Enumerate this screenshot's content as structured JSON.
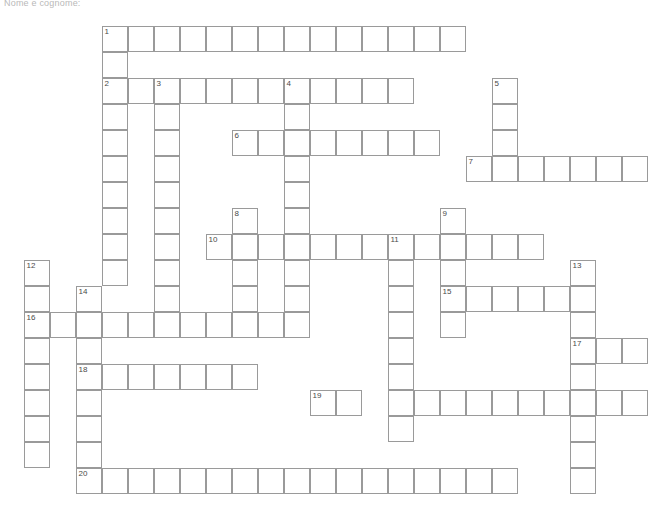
{
  "page": {
    "header_text": "Nome e cognome:"
  },
  "grid": {
    "cell_size": 26,
    "origin_x": 24,
    "origin_y": 26,
    "border_color": "#9a9a9a",
    "cell_fill": "#ffffff",
    "number_color": "#4a4a4a",
    "columns": 24,
    "rows": 19
  },
  "entries": [
    {
      "number": 1,
      "direction": "across",
      "row": 0,
      "col": 3,
      "length": 14
    },
    {
      "number": 1,
      "direction": "down",
      "row": 0,
      "col": 3,
      "length": 2
    },
    {
      "number": 2,
      "direction": "across",
      "row": 2,
      "col": 3,
      "length": 12
    },
    {
      "number": 2,
      "direction": "down",
      "row": 2,
      "col": 3,
      "length": 8
    },
    {
      "number": 3,
      "direction": "down",
      "row": 2,
      "col": 5,
      "length": 9
    },
    {
      "number": 4,
      "direction": "down",
      "row": 2,
      "col": 10,
      "length": 10
    },
    {
      "number": 5,
      "direction": "down",
      "row": 2,
      "col": 18,
      "length": 4
    },
    {
      "number": 6,
      "direction": "across",
      "row": 4,
      "col": 8,
      "length": 8
    },
    {
      "number": 7,
      "direction": "across",
      "row": 5,
      "col": 17,
      "length": 7
    },
    {
      "number": 8,
      "direction": "down",
      "row": 7,
      "col": 8,
      "length": 4
    },
    {
      "number": 9,
      "direction": "down",
      "row": 7,
      "col": 16,
      "length": 5
    },
    {
      "number": 10,
      "direction": "across",
      "row": 8,
      "col": 7,
      "length": 13
    },
    {
      "number": 11,
      "direction": "down",
      "row": 8,
      "col": 14,
      "length": 8
    },
    {
      "number": 12,
      "direction": "down",
      "row": 9,
      "col": 0,
      "length": 8
    },
    {
      "number": 13,
      "direction": "down",
      "row": 9,
      "col": 21,
      "length": 9
    },
    {
      "number": 14,
      "direction": "down",
      "row": 10,
      "col": 2,
      "length": 8
    },
    {
      "number": 15,
      "direction": "across",
      "row": 10,
      "col": 16,
      "length": 5
    },
    {
      "number": 16,
      "direction": "across",
      "row": 11,
      "col": 0,
      "length": 10
    },
    {
      "number": 17,
      "direction": "across",
      "row": 12,
      "col": 21,
      "length": 3
    },
    {
      "number": 18,
      "direction": "across",
      "row": 13,
      "col": 2,
      "length": 7
    },
    {
      "number": 19,
      "direction": "across",
      "row": 14,
      "col": 11,
      "length": 2
    },
    {
      "number": 20,
      "direction": "across",
      "row": 17,
      "col": 2,
      "length": 17
    }
  ],
  "extra_runs": [
    {
      "direction": "across",
      "row": 14,
      "col": 14,
      "length": 10
    }
  ],
  "numbered_cells": [
    {
      "number": 1,
      "row": 0,
      "col": 3
    },
    {
      "number": 2,
      "row": 2,
      "col": 3
    },
    {
      "number": 3,
      "row": 2,
      "col": 5
    },
    {
      "number": 4,
      "row": 2,
      "col": 10
    },
    {
      "number": 5,
      "row": 2,
      "col": 18
    },
    {
      "number": 6,
      "row": 4,
      "col": 8
    },
    {
      "number": 7,
      "row": 5,
      "col": 17
    },
    {
      "number": 8,
      "row": 7,
      "col": 8
    },
    {
      "number": 9,
      "row": 7,
      "col": 16
    },
    {
      "number": 10,
      "row": 8,
      "col": 7
    },
    {
      "number": 11,
      "row": 8,
      "col": 14
    },
    {
      "number": 12,
      "row": 9,
      "col": 0
    },
    {
      "number": 13,
      "row": 9,
      "col": 21
    },
    {
      "number": 14,
      "row": 10,
      "col": 2
    },
    {
      "number": 15,
      "row": 10,
      "col": 16
    },
    {
      "number": 16,
      "row": 11,
      "col": 0
    },
    {
      "number": 17,
      "row": 12,
      "col": 21
    },
    {
      "number": 18,
      "row": 13,
      "col": 2
    },
    {
      "number": 19,
      "row": 14,
      "col": 11
    },
    {
      "number": 20,
      "row": 17,
      "col": 2
    }
  ]
}
